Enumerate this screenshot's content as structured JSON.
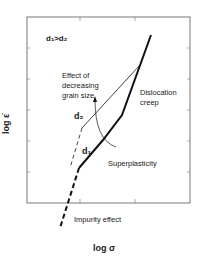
{
  "diagram": {
    "type": "deformation mechanism schematic",
    "x_axis_label": "log σ",
    "y_axis_label": "log ε̇",
    "condition_label": "d₁>d₂",
    "labels": {
      "effect_line1": "Effect of",
      "effect_line2": "decreasing",
      "effect_line3": "grain size",
      "dislocation_line1": "Dislocation",
      "dislocation_line2": "creep",
      "d2": "d₂",
      "d1": "d₁",
      "superplasticity": "Superplasticity",
      "impurity": "Impurity effect"
    },
    "curves": [
      {
        "name": "d1-curve",
        "style": "thick solid",
        "regions": [
          "Impurity effect (dashed)",
          "Superplasticity",
          "Dislocation creep"
        ]
      },
      {
        "name": "d2-curve",
        "style": "thin solid",
        "regions": [
          "dashed low-stress",
          "Superplasticity",
          "merges with dislocation creep"
        ]
      }
    ],
    "colors": {
      "line": "#111111",
      "background": "#ffffff",
      "frame": "#555555"
    }
  }
}
